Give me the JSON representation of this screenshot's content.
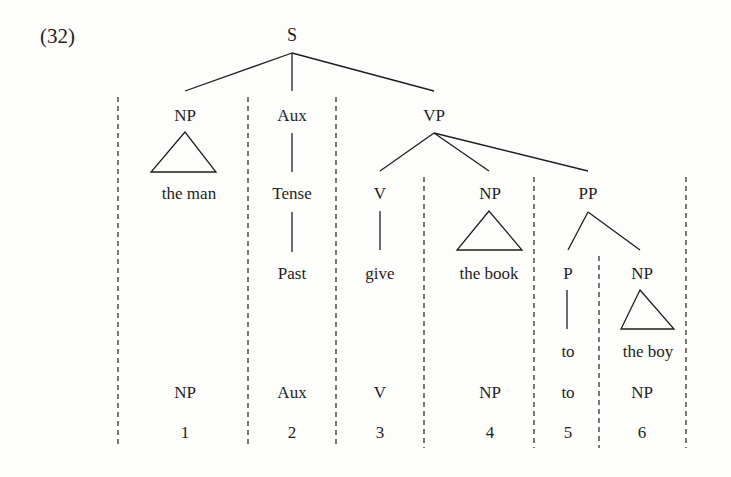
{
  "example_number": "(32)",
  "tree": {
    "root": {
      "label": "S",
      "x": 292,
      "y": 35
    },
    "nodes": [
      {
        "id": "np1",
        "label": "NP",
        "x": 185,
        "y": 115
      },
      {
        "id": "aux",
        "label": "Aux",
        "x": 292,
        "y": 115
      },
      {
        "id": "vp",
        "label": "VP",
        "x": 434,
        "y": 115
      },
      {
        "id": "tense",
        "label": "Tense",
        "x": 292,
        "y": 193
      },
      {
        "id": "past",
        "label": "Past",
        "x": 292,
        "y": 273
      },
      {
        "id": "v",
        "label": "V",
        "x": 380,
        "y": 193
      },
      {
        "id": "np2",
        "label": "NP",
        "x": 490,
        "y": 193
      },
      {
        "id": "pp",
        "label": "PP",
        "x": 588,
        "y": 193
      },
      {
        "id": "give",
        "label": "give",
        "x": 380,
        "y": 273
      },
      {
        "id": "p",
        "label": "P",
        "x": 568,
        "y": 273
      },
      {
        "id": "np3",
        "label": "NP",
        "x": 642,
        "y": 273
      },
      {
        "id": "to",
        "label": "to",
        "x": 568,
        "y": 351
      }
    ],
    "terminals": [
      {
        "id": "the-man",
        "label": "the man",
        "x": 189,
        "y": 193
      },
      {
        "id": "the-book",
        "label": "the book",
        "x": 489,
        "y": 273
      },
      {
        "id": "the-boy",
        "label": "the boy",
        "x": 648,
        "y": 351
      }
    ]
  },
  "analysis": {
    "categories": [
      "NP",
      "Aux",
      "V",
      "NP",
      "to",
      "NP"
    ],
    "indices": [
      "1",
      "2",
      "3",
      "4",
      "5",
      "6"
    ],
    "x_positions": [
      185,
      292,
      380,
      490,
      568,
      642
    ],
    "category_y": 392,
    "index_y": 432
  },
  "colors": {
    "ink": "#1e1e1e",
    "background": "#fdfdfb"
  }
}
